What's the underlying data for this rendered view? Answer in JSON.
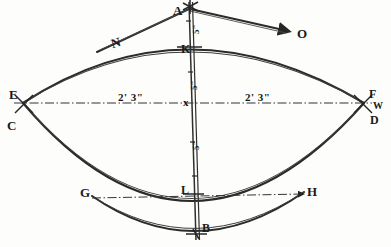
{
  "diagram": {
    "ink_color": "#262626",
    "background_color": "#fdfdfb",
    "points": [
      {
        "id": "A",
        "label": "A",
        "x": 173,
        "y": 4,
        "role": "apex-top-vertex"
      },
      {
        "id": "N",
        "label": "N",
        "x": 111,
        "y": 36,
        "role": "upper-left-chord-mark"
      },
      {
        "id": "O",
        "label": "O",
        "x": 297,
        "y": 27,
        "role": "upper-right-arrow-terminus"
      },
      {
        "id": "K",
        "label": "K",
        "x": 186,
        "y": 43,
        "role": "upper-arc-crown"
      },
      {
        "id": "E",
        "label": "E",
        "x": 9,
        "y": 88,
        "role": "left-upper-label"
      },
      {
        "id": "C",
        "label": "C",
        "x": 7,
        "y": 119,
        "role": "left-lower-label"
      },
      {
        "id": "F",
        "label": "F",
        "x": 369,
        "y": 90,
        "role": "right-upper-label"
      },
      {
        "id": "W",
        "label": "W",
        "x": 374,
        "y": 103,
        "role": "right-middle-label"
      },
      {
        "id": "D",
        "label": "D",
        "x": 371,
        "y": 117,
        "role": "right-lower-label"
      },
      {
        "id": "x",
        "label": "x",
        "x": 186,
        "y": 99,
        "role": "center-point"
      },
      {
        "id": "L",
        "label": "L",
        "x": 186,
        "y": 190,
        "role": "lower-arc-trough"
      },
      {
        "id": "G",
        "label": "G",
        "x": 80,
        "y": 190,
        "role": "lower-left-arrow-start"
      },
      {
        "id": "H",
        "label": "H",
        "x": 307,
        "y": 188,
        "role": "lower-right-arrow-terminus"
      },
      {
        "id": "B",
        "label": "B",
        "x": 203,
        "y": 229,
        "role": "apex-bottom-vertex"
      }
    ],
    "dimensions": {
      "horizontal": [
        {
          "id": "left-half-span",
          "text": "2' 3\"",
          "x": 118,
          "y": 97
        },
        {
          "id": "right-half-span",
          "text": "2' 3\"",
          "x": 245,
          "y": 97
        }
      ],
      "vertical": [
        {
          "id": "a-to-k",
          "text": "5\"",
          "x": 191,
          "y": 35
        },
        {
          "id": "k-to-x",
          "text": "5\"",
          "x": 189,
          "y": 92
        },
        {
          "id": "x-to-l",
          "text": "5\"",
          "x": 189,
          "y": 152
        }
      ]
    },
    "geometry": {
      "center": {
        "x": 186,
        "y": 103
      },
      "left_node": {
        "x": 23,
        "y": 103
      },
      "right_node": {
        "x": 364,
        "y": 103
      },
      "top_vertex": {
        "x": 186,
        "y": 10
      },
      "bottom_vertex": {
        "x": 195,
        "y": 234
      },
      "upper_arc_crown_y": 48,
      "lower_arc_trough_y": 194
    }
  }
}
